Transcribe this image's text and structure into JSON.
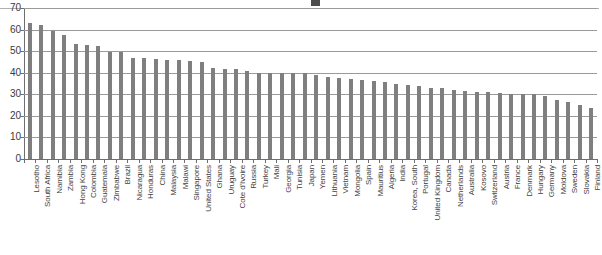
{
  "chart_data": {
    "type": "bar",
    "title": "",
    "xlabel": "",
    "ylabel": "",
    "ylim": [
      0,
      70
    ],
    "ytick_step": 10,
    "yticks": [
      0,
      10,
      20,
      30,
      40,
      50,
      60,
      70
    ],
    "grid": true,
    "legend": "none",
    "bar_color": "#7f7f7f",
    "categories": [
      "Lesotho",
      "South Africa",
      "Namibia",
      "Zambia",
      "Hong Kong",
      "Colombia",
      "Guatemala",
      "Zimbabwe",
      "Brazil",
      "Nicaragua",
      "Honduras",
      "China",
      "Malaysia",
      "Malawi",
      "Singapore",
      "United States",
      "Ghana",
      "Uruguay",
      "Cote d'Ivoire",
      "Russia",
      "Turkey",
      "Mali",
      "Georgia",
      "Tunisia",
      "Japan",
      "Yemen",
      "Lithuania",
      "Vietnam",
      "Mongolia",
      "Spain",
      "Mauritius",
      "Algeria",
      "India",
      "Korea, South",
      "Portugal",
      "United Kingdom",
      "Canada",
      "Netherlands",
      "Australia",
      "Kosovo",
      "Switzerland",
      "Austria",
      "France",
      "Denmark",
      "Hungary",
      "Germany",
      "Moldova",
      "Sweden",
      "Slovakia",
      "Finland"
    ],
    "values": [
      63.0,
      62.0,
      59.5,
      57.5,
      53.5,
      53.0,
      52.5,
      49.5,
      49.5,
      47.0,
      47.0,
      46.5,
      46.0,
      46.0,
      45.5,
      45.0,
      42.0,
      41.5,
      41.5,
      41.0,
      40.0,
      40.0,
      40.0,
      40.0,
      40.0,
      39.0,
      38.0,
      37.5,
      37.0,
      36.5,
      36.0,
      35.5,
      35.0,
      34.5,
      34.0,
      33.0,
      33.0,
      32.0,
      31.5,
      31.0,
      31.0,
      30.5,
      30.0,
      30.0,
      30.0,
      29.0,
      27.5,
      26.5,
      25.0,
      23.5
    ]
  }
}
